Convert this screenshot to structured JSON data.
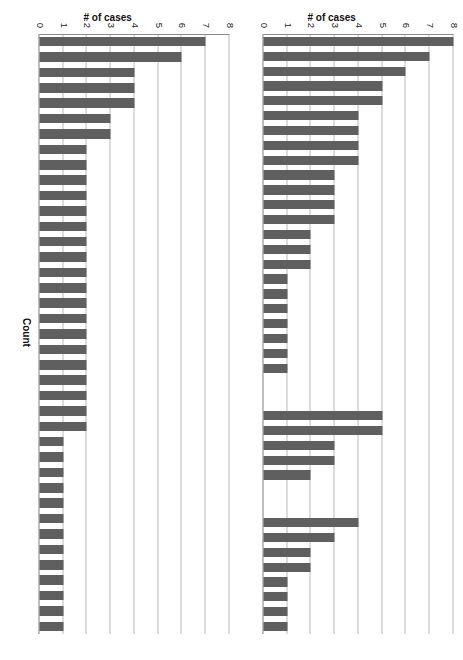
{
  "figure": {
    "rotation_degrees": 90,
    "background": "#ffffff",
    "bar_color": "#5f5f5f",
    "gridline_color": "#b9b9b9",
    "axis_color": "#8a8a8a"
  },
  "chart_data": [
    {
      "id": "panel-top",
      "type": "bar",
      "orientation": "vertical",
      "title": "",
      "xlabel": "",
      "ylabel": "# of cases",
      "ylim": [
        0,
        8
      ],
      "yticks": [
        0,
        1,
        2,
        3,
        4,
        5,
        6,
        7,
        8
      ],
      "ytick_labels": [
        "0",
        "1",
        "2",
        "3",
        "4",
        "5",
        "6",
        "7",
        "8"
      ],
      "grid": true,
      "legend": "none",
      "xtick_labels": [],
      "note": "Three separated groups of bars along the Count axis",
      "groups": [
        {
          "name": "group-1",
          "values": [
            8,
            7,
            6,
            5,
            5,
            4,
            4,
            4,
            4,
            3,
            3,
            3,
            3,
            2,
            2,
            2,
            1,
            1,
            1,
            1,
            1,
            1,
            1
          ]
        },
        {
          "name": "group-2",
          "values": [
            5,
            5,
            3,
            3,
            2
          ]
        },
        {
          "name": "group-3",
          "values": [
            4,
            3,
            2,
            2,
            1,
            1,
            1,
            1
          ]
        }
      ]
    },
    {
      "id": "panel-bottom",
      "type": "bar",
      "orientation": "vertical",
      "title": "",
      "xlabel": "Count",
      "ylabel": "# of cases",
      "ylim": [
        0,
        8
      ],
      "yticks": [
        0,
        1,
        2,
        3,
        4,
        5,
        6,
        7,
        8
      ],
      "ytick_labels": [
        "0",
        "1",
        "2",
        "3",
        "4",
        "5",
        "6",
        "7",
        "8"
      ],
      "grid": true,
      "legend": "none",
      "xtick_labels": [],
      "groups": [
        {
          "name": "series-1",
          "values": [
            7,
            6,
            4,
            4,
            4,
            3,
            3,
            2,
            2,
            2,
            2,
            2,
            2,
            2,
            2,
            2,
            2,
            2,
            2,
            2,
            2,
            2,
            2,
            2,
            2,
            2,
            1,
            1,
            1,
            1,
            1,
            1,
            1,
            1,
            1,
            1,
            1,
            1,
            1
          ]
        }
      ]
    }
  ],
  "labels": {
    "y_axis_title": "# of cases",
    "x_axis_title": "Count",
    "ticks": [
      "0",
      "1",
      "2",
      "3",
      "4",
      "5",
      "6",
      "7",
      "8"
    ]
  }
}
